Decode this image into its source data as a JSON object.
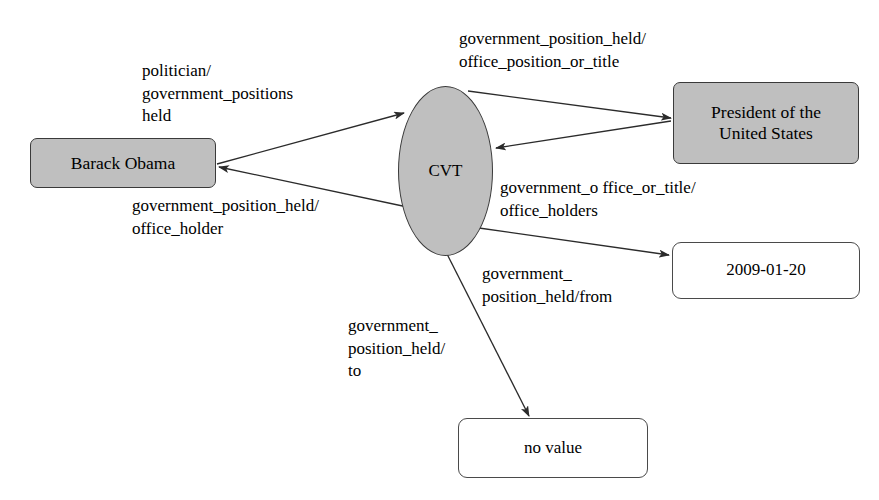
{
  "diagram": {
    "type": "knowledge-graph",
    "background_color": "#ffffff",
    "entity_fill": "#bfbfbf",
    "literal_fill": "#ffffff",
    "stroke_color": "#3a3a3a",
    "nodes": [
      {
        "id": "barack-obama",
        "label": "Barack Obama",
        "kind": "entity"
      },
      {
        "id": "cvt",
        "label": "CVT",
        "kind": "cvt"
      },
      {
        "id": "president",
        "label": "President of the\nUnited States",
        "kind": "entity"
      },
      {
        "id": "date",
        "label": "2009-01-20",
        "kind": "literal"
      },
      {
        "id": "no-value",
        "label": "no value",
        "kind": "literal"
      }
    ],
    "edge_labels": {
      "politician": "politician/\ngovernment_positions\nheld",
      "office_position_or_title": "government_position_held/\noffice_position_or_title",
      "office_holder": "government_position_held/\noffice_holder",
      "office_holders": "government_o ffice_or_title/\noffice_holders",
      "from": "government_\nposition_held/from",
      "to": "government_\nposition_held/\nto"
    },
    "edges": [
      {
        "from": "barack-obama",
        "to": "cvt",
        "label_key": "politician"
      },
      {
        "from": "cvt",
        "to": "barack-obama",
        "label_key": "office_holder"
      },
      {
        "from": "cvt",
        "to": "president",
        "label_key": "office_position_or_title"
      },
      {
        "from": "president",
        "to": "cvt",
        "label_key": "office_holders"
      },
      {
        "from": "cvt",
        "to": "date",
        "label_key": "from"
      },
      {
        "from": "cvt",
        "to": "no-value",
        "label_key": "to"
      }
    ]
  }
}
